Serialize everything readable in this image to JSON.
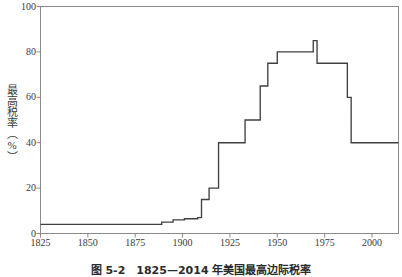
{
  "chart_data": {
    "type": "line",
    "line_style": "step-post",
    "title": "",
    "subtitle": "",
    "xlabel": "",
    "ylabel": "最高税率（%）",
    "xlim": [
      1825,
      2014
    ],
    "ylim": [
      0,
      100
    ],
    "grid": false,
    "legend": null,
    "line_color": "#404040",
    "axis_color": "#8a8a8a",
    "xticks": [
      1825,
      1850,
      1875,
      1900,
      1925,
      1950,
      1975,
      2000
    ],
    "xticklabels": [
      "1825",
      "1850",
      "1875",
      "1900",
      "1925",
      "1950",
      "1975",
      "2000"
    ],
    "yticks": [
      0,
      20,
      40,
      60,
      80,
      100
    ],
    "yticklabels": [
      "0",
      "20",
      "40",
      "60",
      "80",
      "100"
    ],
    "x": [
      1825,
      1889,
      1895,
      1901,
      1908,
      1910,
      1914,
      1919,
      1929,
      1933,
      1937,
      1941,
      1945,
      1950,
      1964,
      1969,
      1971,
      1982,
      1987,
      1989,
      2014
    ],
    "values": [
      4,
      5,
      6,
      6.5,
      7,
      15,
      20,
      40,
      40,
      50,
      50,
      65,
      75,
      80,
      80,
      85,
      75,
      75,
      60,
      40,
      40
    ],
    "annotations": []
  },
  "axis": {
    "ylabel_text": "最高税率（%）"
  },
  "caption": {
    "text": "图 5-2　1825—2014 年美国最高边际税率"
  }
}
